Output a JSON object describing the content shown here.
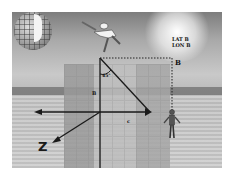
{
  "diagram": {
    "labels": {
      "angle": "45°",
      "lat": "LAT B",
      "lon": "LON B",
      "point_b": "B",
      "side_a": "B",
      "side_c": "c",
      "axis_z": "Z"
    },
    "elements": {
      "globe": "globe-with-grid",
      "jumper": "person-jumping",
      "observer": "person-standing",
      "triangle": "right-triangle",
      "axes": [
        "horizontal-axis-left-arrow",
        "z-axis-diagonal-arrow",
        "vertical-axis"
      ]
    },
    "colors": {
      "line": "#1a1a1a",
      "dotted": "#222222",
      "sky": "#a9a9a9",
      "field": "#cfcfcf"
    }
  }
}
